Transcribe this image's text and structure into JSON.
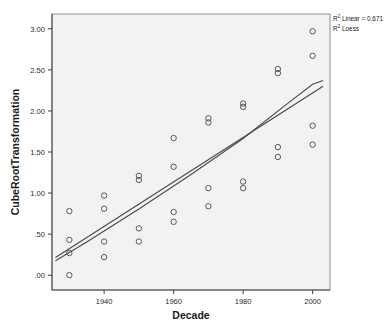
{
  "chart_data": {
    "type": "scatter",
    "title": "",
    "xlabel": "Decade",
    "ylabel": "CubeRootTransformation",
    "xlim": [
      1925,
      2005
    ],
    "ylim": [
      -0.18,
      3.18
    ],
    "xticks": [
      1940,
      1960,
      1980,
      2000
    ],
    "xtick_labels": [
      "1940",
      "1960",
      "1980",
      "2000"
    ],
    "yticks": [
      0.0,
      0.5,
      1.0,
      1.5,
      2.0,
      2.5,
      3.0
    ],
    "ytick_labels": [
      ".00",
      ".50",
      "1.00",
      "1.50",
      "2.00",
      "2.50",
      "3.00"
    ],
    "grid": false,
    "marker": "open-circle",
    "marker_color": "#55595c",
    "points": [
      {
        "x": 1930,
        "y": 0.78
      },
      {
        "x": 1930,
        "y": 0.43
      },
      {
        "x": 1930,
        "y": 0.27
      },
      {
        "x": 1930,
        "y": 0.0
      },
      {
        "x": 1940,
        "y": 0.97
      },
      {
        "x": 1940,
        "y": 0.81
      },
      {
        "x": 1940,
        "y": 0.41
      },
      {
        "x": 1940,
        "y": 0.22
      },
      {
        "x": 1950,
        "y": 1.21
      },
      {
        "x": 1950,
        "y": 1.16
      },
      {
        "x": 1950,
        "y": 0.57
      },
      {
        "x": 1950,
        "y": 0.41
      },
      {
        "x": 1960,
        "y": 1.67
      },
      {
        "x": 1960,
        "y": 1.32
      },
      {
        "x": 1960,
        "y": 0.77
      },
      {
        "x": 1960,
        "y": 0.65
      },
      {
        "x": 1970,
        "y": 1.91
      },
      {
        "x": 1970,
        "y": 1.86
      },
      {
        "x": 1970,
        "y": 1.06
      },
      {
        "x": 1970,
        "y": 0.84
      },
      {
        "x": 1980,
        "y": 2.09
      },
      {
        "x": 1980,
        "y": 2.05
      },
      {
        "x": 1980,
        "y": 1.14
      },
      {
        "x": 1980,
        "y": 1.06
      },
      {
        "x": 1990,
        "y": 2.51
      },
      {
        "x": 1990,
        "y": 2.46
      },
      {
        "x": 1990,
        "y": 1.56
      },
      {
        "x": 1990,
        "y": 1.44
      },
      {
        "x": 2000,
        "y": 2.97
      },
      {
        "x": 2000,
        "y": 2.67
      },
      {
        "x": 2000,
        "y": 1.82
      },
      {
        "x": 2000,
        "y": 1.59
      }
    ],
    "series": [
      {
        "name": "Linear fit",
        "type": "line",
        "color": "#4a4a4a",
        "x": [
          1926,
          2003
        ],
        "y": [
          0.215,
          2.3
        ]
      },
      {
        "name": "Loess fit",
        "type": "line",
        "color": "#4a4a4a",
        "x": [
          1926,
          1935,
          1950,
          1965,
          1980,
          1992,
          2000,
          2003
        ],
        "y": [
          0.175,
          0.405,
          0.805,
          1.225,
          1.665,
          2.065,
          2.325,
          2.37
        ]
      }
    ]
  },
  "legend": {
    "position": "top-right",
    "entries": [
      {
        "symbol": "R",
        "superscript": "2",
        "text": " Linear = 0.671"
      },
      {
        "symbol": "R",
        "superscript": "2",
        "text": " Loess"
      }
    ]
  },
  "panel": {
    "background": "#f2f2f2",
    "border_color": "#9a9a9a"
  }
}
